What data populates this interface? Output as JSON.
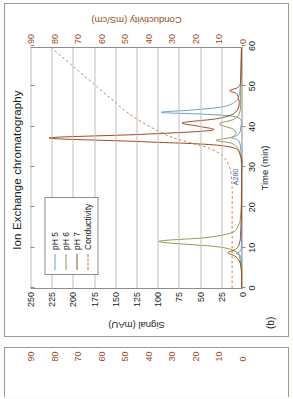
{
  "figure": {
    "panel_letter": "(b)",
    "title": "Ion Exchange chromatography"
  },
  "axes": {
    "x_title": "Time (min)",
    "y_left_title": "Signal (mAU)",
    "y_right_title": "Conductivity (mS/cm)",
    "x_ticks": [
      "0",
      "10",
      "20",
      "30",
      "40",
      "50",
      "60"
    ],
    "y_left_ticks": [
      "0",
      "25",
      "50",
      "75",
      "100",
      "125",
      "150",
      "175",
      "200",
      "225",
      "250"
    ],
    "y_right_ticks": [
      "0",
      "10",
      "20",
      "30",
      "40",
      "50",
      "60",
      "70",
      "80",
      "90"
    ]
  },
  "legend": {
    "items": [
      {
        "label": "pH 5",
        "color": "#6d9ec4",
        "style": "solid"
      },
      {
        "label": "pH 6",
        "color": "#8f9a4e",
        "style": "solid"
      },
      {
        "label": "pH 7",
        "color": "#9c4a21",
        "style": "solid"
      },
      {
        "label": "Conductivity",
        "color": "#c0703a",
        "style": "dashed"
      }
    ]
  },
  "annotations": [
    {
      "text": "A280",
      "x_min": 25.5,
      "y_mau": 6
    }
  ],
  "colors": {
    "ph5": "#6d9ec4",
    "ph6": "#8f9a4e",
    "ph7": "#9c4a21",
    "conductivity": "#c0703a",
    "axis": "#8d8d8d",
    "grid": "#bfbfbf",
    "text": "#1b1b1b",
    "panel_border": "#9a9a9a"
  },
  "bottom_strip": {
    "y_right_title": "Conductivity (mS/cm)",
    "y_right_ticks": [
      "0",
      "10",
      "20",
      "30",
      "40",
      "50",
      "60",
      "70",
      "80",
      "90"
    ]
  },
  "chart_data": {
    "type": "line",
    "title": "Ion Exchange chromatography",
    "xlabel": "Time (min)",
    "ylabel": "Signal (mAU)",
    "y2label": "Conductivity (mS/cm)",
    "xlim": [
      0,
      60
    ],
    "ylim": [
      0,
      250
    ],
    "y2lim": [
      0,
      90
    ],
    "grid": "horizontal",
    "legend_position": "upper-left",
    "note": "Chromatogram drawn rotated 90 degrees (page is sideways). Three UV traces (pH 5/6/7) on left axis plus a dashed conductivity gradient on the right axis.",
    "series": [
      {
        "name": "pH 5",
        "color": "#6d9ec4",
        "axis": "left",
        "style": "solid",
        "peaks": [
          {
            "time_min": 8.6,
            "height_mau": 6
          },
          {
            "time_min": 37.6,
            "height_mau": 12
          },
          {
            "time_min": 43.9,
            "height_mau": 95
          }
        ],
        "points": [
          [
            0,
            0
          ],
          [
            5,
            0
          ],
          [
            8.0,
            1
          ],
          [
            8.6,
            6
          ],
          [
            9.3,
            1
          ],
          [
            12,
            0
          ],
          [
            20,
            0
          ],
          [
            30,
            0
          ],
          [
            35,
            1
          ],
          [
            37.0,
            4
          ],
          [
            37.6,
            12
          ],
          [
            38.3,
            4
          ],
          [
            40,
            1
          ],
          [
            42.6,
            4
          ],
          [
            43.4,
            40
          ],
          [
            43.9,
            95
          ],
          [
            44.5,
            58
          ],
          [
            45.3,
            22
          ],
          [
            46.5,
            8
          ],
          [
            48,
            3
          ],
          [
            52,
            1
          ],
          [
            60,
            0
          ]
        ]
      },
      {
        "name": "pH 6",
        "color": "#8f9a4e",
        "axis": "left",
        "style": "solid",
        "peaks": [
          {
            "time_min": 11.6,
            "height_mau": 98
          },
          {
            "time_min": 36.9,
            "height_mau": 30
          },
          {
            "time_min": 41.0,
            "height_mau": 26
          }
        ],
        "points": [
          [
            0,
            0
          ],
          [
            4,
            0
          ],
          [
            7.5,
            2
          ],
          [
            9.0,
            6
          ],
          [
            10.3,
            28
          ],
          [
            11.6,
            98
          ],
          [
            12.6,
            42
          ],
          [
            13.8,
            12
          ],
          [
            15.5,
            4
          ],
          [
            18,
            1
          ],
          [
            25,
            0
          ],
          [
            33,
            1
          ],
          [
            36.0,
            10
          ],
          [
            36.9,
            30
          ],
          [
            37.8,
            10
          ],
          [
            39.5,
            8
          ],
          [
            41.0,
            26
          ],
          [
            42.2,
            9
          ],
          [
            44,
            2
          ],
          [
            48,
            1
          ],
          [
            60,
            0
          ]
        ]
      },
      {
        "name": "pH 7",
        "color": "#9c4a21",
        "axis": "left",
        "style": "solid",
        "peaks": [
          {
            "time_min": 8.8,
            "height_mau": 16
          },
          {
            "time_min": 37.5,
            "height_mau": 228
          },
          {
            "time_min": 41.3,
            "height_mau": 70
          },
          {
            "time_min": 49.3,
            "height_mau": 14
          }
        ],
        "points": [
          [
            0,
            0
          ],
          [
            4,
            0
          ],
          [
            6.5,
            2
          ],
          [
            8.0,
            8
          ],
          [
            8.8,
            16
          ],
          [
            9.8,
            6
          ],
          [
            11.5,
            2
          ],
          [
            14,
            1
          ],
          [
            20,
            0
          ],
          [
            28,
            0
          ],
          [
            33,
            1
          ],
          [
            35.5,
            20
          ],
          [
            36.6,
            120
          ],
          [
            37.5,
            228
          ],
          [
            38.4,
            120
          ],
          [
            39.4,
            36
          ],
          [
            40.4,
            50
          ],
          [
            41.3,
            70
          ],
          [
            42.3,
            30
          ],
          [
            43.5,
            10
          ],
          [
            45.5,
            3
          ],
          [
            48.4,
            5
          ],
          [
            49.3,
            14
          ],
          [
            50.2,
            4
          ],
          [
            52,
            1
          ],
          [
            60,
            0
          ]
        ]
      },
      {
        "name": "Conductivity",
        "color": "#c0703a",
        "axis": "right",
        "style": "dashed",
        "points": [
          [
            0,
            4
          ],
          [
            3,
            4
          ],
          [
            6,
            4
          ],
          [
            10,
            4
          ],
          [
            15,
            4
          ],
          [
            20,
            4
          ],
          [
            25,
            4
          ],
          [
            30,
            5
          ],
          [
            33,
            8
          ],
          [
            35,
            14
          ],
          [
            36,
            20
          ],
          [
            37,
            26
          ],
          [
            38,
            31
          ],
          [
            40,
            38
          ],
          [
            42,
            44
          ],
          [
            44,
            49
          ],
          [
            46,
            53
          ],
          [
            48,
            57
          ],
          [
            50,
            61
          ],
          [
            52,
            65
          ],
          [
            54,
            69
          ],
          [
            56,
            73
          ],
          [
            58,
            77
          ],
          [
            60,
            81
          ]
        ]
      }
    ]
  }
}
